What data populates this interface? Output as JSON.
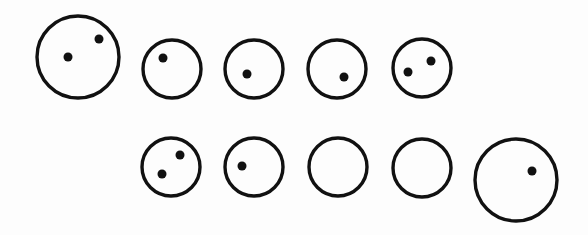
{
  "figure": {
    "background": "#fdfdfd",
    "stroke_color": "#111111",
    "circles": [
      {
        "id": "c1",
        "row": 1,
        "size": "large",
        "cx": 78,
        "cy": 57,
        "r": 41,
        "dots": [
          [
            68,
            57
          ],
          [
            99,
            39
          ]
        ]
      },
      {
        "id": "c2",
        "row": 1,
        "size": "small",
        "cx": 172,
        "cy": 69,
        "r": 29,
        "dots": [
          [
            163,
            58
          ]
        ]
      },
      {
        "id": "c3",
        "row": 1,
        "size": "small",
        "cx": 254,
        "cy": 69,
        "r": 29,
        "dots": [
          [
            247,
            74
          ]
        ]
      },
      {
        "id": "c4",
        "row": 1,
        "size": "small",
        "cx": 337,
        "cy": 69,
        "r": 29,
        "dots": [
          [
            344,
            77
          ]
        ]
      },
      {
        "id": "c5",
        "row": 1,
        "size": "small",
        "cx": 422,
        "cy": 68,
        "r": 29,
        "dots": [
          [
            408,
            72
          ],
          [
            431,
            61
          ]
        ]
      },
      {
        "id": "c6",
        "row": 2,
        "size": "small",
        "cx": 171,
        "cy": 167,
        "r": 29,
        "dots": [
          [
            162,
            174
          ],
          [
            180,
            155
          ]
        ]
      },
      {
        "id": "c7",
        "row": 2,
        "size": "small",
        "cx": 254,
        "cy": 167,
        "r": 29,
        "dots": [
          [
            242,
            166
          ]
        ]
      },
      {
        "id": "c8",
        "row": 2,
        "size": "small",
        "cx": 338,
        "cy": 167,
        "r": 29,
        "dots": []
      },
      {
        "id": "c9",
        "row": 2,
        "size": "small",
        "cx": 422,
        "cy": 168,
        "r": 29,
        "dots": []
      },
      {
        "id": "c10",
        "row": 2,
        "size": "large",
        "cx": 516,
        "cy": 180,
        "r": 41,
        "dots": [
          [
            532,
            171
          ]
        ]
      }
    ],
    "dot_radius": 4.5
  }
}
